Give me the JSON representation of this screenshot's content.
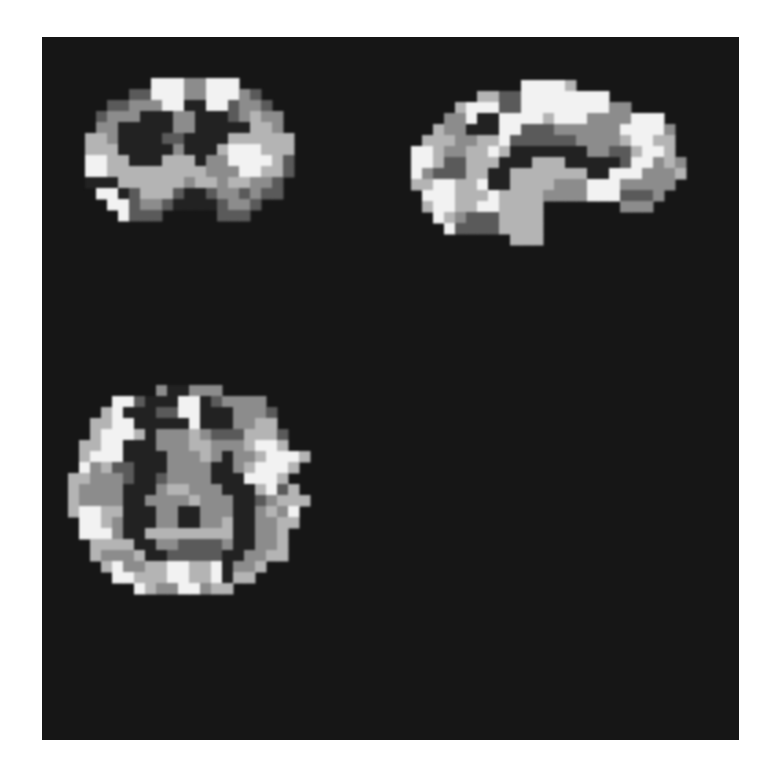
{
  "figure": {
    "background_color": "#161616",
    "page_color": "#ffffff",
    "panel": {
      "x": 42,
      "y": 37,
      "width": 697,
      "height": 703
    },
    "gray_levels": {
      "white": "#f2f2f2",
      "light": "#b4b4b4",
      "mid": "#8c8c8c",
      "dark": "#5a5a5a",
      "black": "#222222"
    }
  },
  "slices": [
    {
      "name": "coronal",
      "voxel": 11,
      "origin": [
        85,
        78
      ],
      "rows": [
        "......WWWMMWWW......",
        "....DDWWWMMWWWMD....",
        "..DDMMMWWBBWWDMMD...",
        ".DMMMBBBMMBBBDMLMM..",
        ".MMBBBBBMMBBBBBLLM..",
        "LLMBBBBDDBBBBLLLLLL.",
        "LLLBBBBBMBBBLWWWLLL.",
        "WWLLBBBLLLBMMWWWWLD.",
        "WWLLLLLLLLLMMMWWLLD.",
        "BBBLLLLLLMLLMLLMMD..",
        ".WWBDLLLDBBDMMDMDD..",
        "..WWDMMDBBBBDMMD....",
        "...WDDD.....DDD....."
      ]
    },
    {
      "name": "sagittal",
      "voxel": 11,
      "origin": [
        400,
        80
      ],
      "rows": [
        "...........WWWWL..........",
        ".......LLDDWWWWWWWW.......",
        ".....LWWWDDWWWWWWWWMM.....",
        "....MMWBBWWWWLWWWMMMMWWW..",
        "...LMMBBBWWDDDMMMMMMWWWWM.",
        "..LLLMMLLWDDDDDDMMMMLWWLL.",
        ".WWLMMLLWLBBBBBBBMMDDLWWL.",
        ".WWLDDLLLBBBLLLBBBBBDWWMLM",
        ".WMDDDLLBBLLLLLLLBBWWWMMML",
        ".LLWWLLWBBLLLLMMMWWWMMMMM.",
        "..WWWLLLWLLLLMMMMWWWDDDM..",
        "..LWWLLWWLLLL.......MMM...",
        "...WLMDDDLLLL.............",
        "....WDDDDLLLL.............",
        "..........LLL............."
      ]
    },
    {
      "name": "axial",
      "voxel": 11,
      "origin": [
        68,
        385
      ],
      "rows": [
        "........MBBMMM........",
        "....WWDBBBWWBDMMMM....",
        "...LWBBBDDWWBBBMMMD...",
        "..LLWWBBBBBWBBBMMLL...",
        "..LWWWLBMMMLMDDDLLLD..",
        ".LLWWBBBMMMLLMMMLWWL..",
        ".LWWWBBBBMMMLMBMMLWWWL",
        ".WMLDDBBBMMMMBBMLWWWL.",
        "LLMMMDBBDMMMMBBBWWWL..",
        "LMMMMBBBMLLMMMBBBLWDL.",
        "LMMMMBBMMMMLMMMBBDMLLL",
        "LWWLLBBBMMBBMMMBBMLMW.",
        ".WWLMBBBMMBBMMLBBMMLL.",
        ".WWWMBBLLLLLLLLBBMML..",
        "..LLLLBBMMDDDDMBBMML..",
        "..LMMMLBBDDDDDBBMMLL..",
        "...LWMMLLWWLLWBMML....",
        "....WWLLLWWLLWBLL.....",
        "......WLMMWWMLL......."
      ]
    }
  ]
}
